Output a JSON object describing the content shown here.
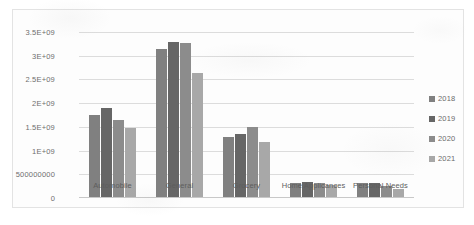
{
  "chart_data": {
    "type": "bar",
    "title": "",
    "xlabel": "",
    "ylabel": "",
    "ylim": [
      0,
      3500000000
    ],
    "grid": true,
    "legend_position": "right",
    "categories": [
      "Automobile",
      "General",
      "Grocery",
      "Home Applicances",
      "Personal Needs"
    ],
    "ytick_labels": [
      "3.5E+09",
      "3E+09",
      "2.5E+09",
      "2E+09",
      "1.5E+09",
      "1E+09",
      "500000000",
      "0"
    ],
    "ytick_values": [
      3500000000,
      3000000000,
      2500000000,
      2000000000,
      1500000000,
      1000000000,
      500000000,
      0
    ],
    "series": [
      {
        "name": "2018",
        "color": "#808080",
        "values": [
          1750000000,
          3150000000,
          1280000000,
          320000000,
          310000000
        ]
      },
      {
        "name": "2019",
        "color": "#666666",
        "values": [
          1900000000,
          3300000000,
          1360000000,
          330000000,
          320000000
        ]
      },
      {
        "name": "2020",
        "color": "#8c8c8c",
        "values": [
          1640000000,
          3270000000,
          1500000000,
          310000000,
          250000000
        ]
      },
      {
        "name": "2021",
        "color": "#a8a8a8",
        "values": [
          1480000000,
          2630000000,
          1180000000,
          270000000,
          200000000
        ]
      }
    ]
  },
  "colors": {
    "frame_border": "#e3e3e3",
    "gridline": "#dcdcdc",
    "tick_text": "#6e6e6e",
    "category_text": "#5d5d5d"
  }
}
